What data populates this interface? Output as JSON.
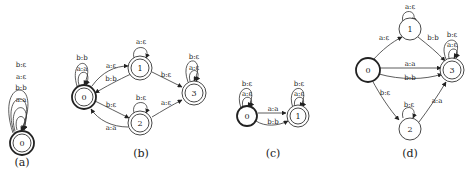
{
  "figure": {
    "panels": [
      {
        "id": "a",
        "caption": "(a)",
        "states": [
          {
            "id": "0",
            "label": "0",
            "initial": true,
            "accepting": true
          }
        ],
        "transitions": [
          {
            "from": "0",
            "to": "0",
            "label": "a:a"
          },
          {
            "from": "0",
            "to": "0",
            "label": "b:b"
          },
          {
            "from": "0",
            "to": "0",
            "label": "a:ε"
          },
          {
            "from": "0",
            "to": "0",
            "label": "b:ε"
          }
        ]
      },
      {
        "id": "b",
        "caption": "(b)",
        "states": [
          {
            "id": "0",
            "label": "0",
            "initial": true,
            "accepting": true
          },
          {
            "id": "1",
            "label": "1",
            "initial": false,
            "accepting": true
          },
          {
            "id": "2",
            "label": "2",
            "initial": false,
            "accepting": true
          },
          {
            "id": "3",
            "label": "3",
            "initial": false,
            "accepting": true
          }
        ],
        "transitions": [
          {
            "from": "0",
            "to": "0",
            "label": "a:a"
          },
          {
            "from": "0",
            "to": "0",
            "label": "b:b"
          },
          {
            "from": "0",
            "to": "1",
            "label": "a:ε"
          },
          {
            "from": "1",
            "to": "0",
            "label": "b:b"
          },
          {
            "from": "0",
            "to": "2",
            "label": "b:ε"
          },
          {
            "from": "2",
            "to": "0",
            "label": "a:a"
          },
          {
            "from": "1",
            "to": "1",
            "label": "a:ε"
          },
          {
            "from": "2",
            "to": "2",
            "label": "b:ε"
          },
          {
            "from": "1",
            "to": "3",
            "label": "b:ε"
          },
          {
            "from": "2",
            "to": "3",
            "label": "a:ε"
          },
          {
            "from": "3",
            "to": "3",
            "label": "a:ε"
          },
          {
            "from": "3",
            "to": "3",
            "label": "b:ε"
          }
        ]
      },
      {
        "id": "c",
        "caption": "(c)",
        "states": [
          {
            "id": "0",
            "label": "0",
            "initial": true,
            "accepting": false
          },
          {
            "id": "1",
            "label": "1",
            "initial": false,
            "accepting": true
          }
        ],
        "transitions": [
          {
            "from": "0",
            "to": "0",
            "label": "a:ε"
          },
          {
            "from": "0",
            "to": "0",
            "label": "b:ε"
          },
          {
            "from": "0",
            "to": "1",
            "label": "a:a"
          },
          {
            "from": "0",
            "to": "1",
            "label": "b:b"
          },
          {
            "from": "1",
            "to": "1",
            "label": "a:ε"
          },
          {
            "from": "1",
            "to": "1",
            "label": "b:ε"
          }
        ]
      },
      {
        "id": "d",
        "caption": "(d)",
        "states": [
          {
            "id": "0",
            "label": "0",
            "initial": true,
            "accepting": false
          },
          {
            "id": "1",
            "label": "1",
            "initial": false,
            "accepting": false
          },
          {
            "id": "2",
            "label": "2",
            "initial": false,
            "accepting": false
          },
          {
            "id": "3",
            "label": "3",
            "initial": false,
            "accepting": true
          }
        ],
        "transitions": [
          {
            "from": "0",
            "to": "1",
            "label": "a:ε"
          },
          {
            "from": "1",
            "to": "1",
            "label": "a:ε"
          },
          {
            "from": "1",
            "to": "3",
            "label": "b:b"
          },
          {
            "from": "0",
            "to": "3",
            "label": "a:a"
          },
          {
            "from": "0",
            "to": "3",
            "label": "b:b"
          },
          {
            "from": "0",
            "to": "2",
            "label": "b:ε"
          },
          {
            "from": "2",
            "to": "2",
            "label": "b:ε"
          },
          {
            "from": "2",
            "to": "3",
            "label": "a:a"
          },
          {
            "from": "3",
            "to": "3",
            "label": "a:ε"
          },
          {
            "from": "3",
            "to": "3",
            "label": "b:ε"
          }
        ]
      }
    ]
  }
}
